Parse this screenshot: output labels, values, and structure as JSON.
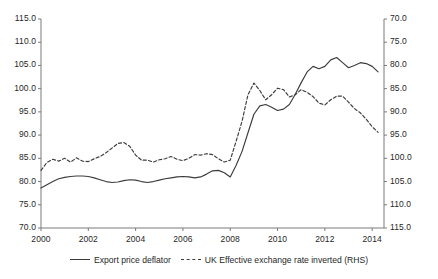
{
  "chart_data": {
    "type": "line",
    "title": "",
    "subtitle": "",
    "xlabel": "",
    "ylabel": "",
    "grid": false,
    "legend_position": "bottom",
    "x_axis": {
      "ticks": [
        "2000",
        "2002",
        "2004",
        "2006",
        "2008",
        "2010",
        "2012",
        "2014"
      ],
      "tick_values": [
        2000,
        2002,
        2004,
        2006,
        2008,
        2010,
        2012,
        2014
      ],
      "min": 2000,
      "max": 2014.5
    },
    "y_left": {
      "label": "",
      "ticks": [
        "70.0",
        "75.0",
        "80.0",
        "85.0",
        "90.0",
        "95.0",
        "100.0",
        "105.0",
        "110.0",
        "115.0"
      ],
      "tick_values": [
        70,
        75,
        80,
        85,
        90,
        95,
        100,
        105,
        110,
        115
      ],
      "min": 70,
      "max": 115,
      "inverted": false
    },
    "y_right": {
      "label": "RHS",
      "ticks": [
        "70.0",
        "75.0",
        "80.0",
        "85.0",
        "90.0",
        "95.0",
        "100.0",
        "105.0",
        "110.0",
        "115.0"
      ],
      "tick_values": [
        70,
        75,
        80,
        85,
        90,
        95,
        100,
        105,
        110,
        115
      ],
      "min": 70,
      "max": 115,
      "inverted": true
    },
    "series": [
      {
        "name": "Export price deflator",
        "style": "solid",
        "color": "#3c3c3c",
        "axis": "left",
        "x": [
          2000.0,
          2000.25,
          2000.5,
          2000.75,
          2001.0,
          2001.25,
          2001.5,
          2001.75,
          2002.0,
          2002.25,
          2002.5,
          2002.75,
          2003.0,
          2003.25,
          2003.5,
          2003.75,
          2004.0,
          2004.25,
          2004.5,
          2004.75,
          2005.0,
          2005.25,
          2005.5,
          2005.75,
          2006.0,
          2006.25,
          2006.5,
          2006.75,
          2007.0,
          2007.25,
          2007.5,
          2007.75,
          2008.0,
          2008.25,
          2008.5,
          2008.75,
          2009.0,
          2009.25,
          2009.5,
          2009.75,
          2010.0,
          2010.25,
          2010.5,
          2010.75,
          2011.0,
          2011.25,
          2011.5,
          2011.75,
          2012.0,
          2012.25,
          2012.5,
          2012.75,
          2013.0,
          2013.25,
          2013.5,
          2013.75,
          2014.0,
          2014.25
        ],
        "values": [
          78.6,
          79.3,
          80.0,
          80.6,
          80.9,
          81.1,
          81.2,
          81.2,
          81.1,
          80.8,
          80.4,
          80.0,
          79.8,
          79.9,
          80.2,
          80.4,
          80.3,
          80.0,
          79.8,
          80.0,
          80.3,
          80.6,
          80.8,
          81.0,
          81.1,
          81.0,
          80.8,
          81.0,
          81.6,
          82.3,
          82.4,
          81.9,
          81.0,
          83.5,
          86.5,
          90.5,
          94.5,
          96.3,
          96.6,
          96.0,
          95.3,
          95.6,
          96.6,
          98.8,
          101.3,
          103.6,
          104.8,
          104.3,
          104.8,
          106.2,
          106.7,
          105.6,
          104.5,
          105.0,
          105.6,
          105.4,
          104.8,
          103.6
        ]
      },
      {
        "name": "UK Effective exchange rate inverted (RHS)",
        "style": "dashed",
        "color": "#3c3c3c",
        "axis": "right",
        "x": [
          2000.0,
          2000.25,
          2000.5,
          2000.75,
          2001.0,
          2001.25,
          2001.5,
          2001.75,
          2002.0,
          2002.25,
          2002.5,
          2002.75,
          2003.0,
          2003.25,
          2003.5,
          2003.75,
          2004.0,
          2004.25,
          2004.5,
          2004.75,
          2005.0,
          2005.25,
          2005.5,
          2005.75,
          2006.0,
          2006.25,
          2006.5,
          2006.75,
          2007.0,
          2007.25,
          2007.5,
          2007.75,
          2008.0,
          2008.25,
          2008.5,
          2008.75,
          2009.0,
          2009.25,
          2009.5,
          2009.75,
          2010.0,
          2010.25,
          2010.5,
          2010.75,
          2011.0,
          2011.25,
          2011.5,
          2011.75,
          2012.0,
          2012.25,
          2012.5,
          2012.75,
          2013.0,
          2013.25,
          2013.5,
          2013.75,
          2014.0,
          2014.25
        ],
        "values": [
          102.6,
          100.9,
          100.2,
          100.6,
          100.0,
          100.8,
          99.9,
          100.6,
          100.7,
          100.1,
          99.6,
          98.8,
          97.8,
          96.8,
          96.6,
          97.4,
          99.3,
          100.4,
          100.4,
          100.8,
          100.3,
          100.1,
          99.6,
          100.2,
          100.5,
          100.0,
          99.2,
          99.3,
          99.0,
          99.2,
          100.1,
          100.8,
          100.4,
          96.3,
          92.0,
          86.3,
          83.8,
          85.4,
          87.4,
          86.3,
          84.9,
          85.2,
          86.8,
          86.3,
          85.2,
          85.8,
          86.7,
          88.1,
          88.5,
          87.4,
          86.6,
          86.6,
          87.9,
          89.3,
          90.2,
          91.6,
          93.2,
          94.4
        ]
      }
    ]
  },
  "legend": {
    "items": [
      {
        "label": "Export price deflator",
        "style": "solid"
      },
      {
        "label": "UK Effective exchange rate inverted (RHS)",
        "style": "dashed"
      }
    ]
  },
  "colors": {
    "line": "#3c3c3c",
    "axis": "#7a7a7a",
    "text": "#1f1f1f",
    "background": "#ffffff"
  }
}
